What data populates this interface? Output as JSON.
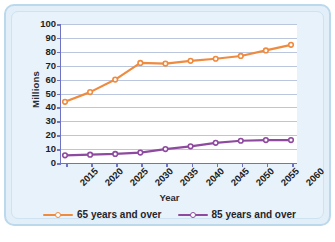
{
  "chart_data": {
    "type": "line",
    "title": "",
    "xlabel": "Year",
    "ylabel": "Millions",
    "categories": [
      "2015",
      "2020",
      "2025",
      "2030",
      "2035",
      "2040",
      "2045",
      "2050",
      "2055",
      "2060"
    ],
    "x": [
      2015,
      2020,
      2025,
      2030,
      2035,
      2040,
      2045,
      2050,
      2055,
      2060
    ],
    "ylim": [
      0,
      100
    ],
    "yticks": [
      0,
      10,
      20,
      30,
      40,
      50,
      60,
      70,
      80,
      90,
      100
    ],
    "ytick_labels": [
      "0",
      "10",
      "20",
      "30",
      "40",
      "50",
      "60",
      "70",
      "80",
      "90",
      "100"
    ],
    "grid": "horizontal",
    "legend_position": "bottom",
    "series": [
      {
        "name": "65 years and over",
        "color": "#ef8b3f",
        "marker": "circle",
        "values": [
          44,
          51,
          60,
          72,
          71.5,
          73.5,
          75,
          77,
          81,
          85
        ]
      },
      {
        "name": "85 years and over",
        "color": "#8e4a9e",
        "marker": "circle",
        "values": [
          5.5,
          6,
          6.5,
          7.5,
          10,
          12,
          14.5,
          16,
          16.5,
          16.5
        ]
      }
    ]
  },
  "legend": {
    "items": [
      {
        "label": "65 years and over",
        "color": "#ef8b3f"
      },
      {
        "label": "85 years and over",
        "color": "#8e4a9e"
      }
    ]
  },
  "axes": {
    "y_title": "Millions",
    "x_title": "Year"
  },
  "colors": {
    "frame_border": "#bcd8ec",
    "frame_background": "#e8f2fa",
    "plot_background": "#ffffff",
    "gridline": "#b9c6dd",
    "axis_line": "#6f73c4",
    "series_65": "#ef8b3f",
    "series_85": "#8e4a9e"
  }
}
